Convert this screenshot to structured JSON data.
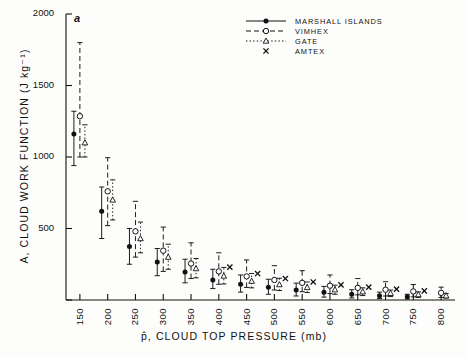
{
  "figure": {
    "panel_label": "a",
    "background": "#fdfdfb",
    "ink": "#111111"
  },
  "legend": {
    "position": "top-right",
    "entries": [
      {
        "label": "MARSHALL ISLANDS",
        "marker": "filled-circle",
        "line": "solid",
        "key": "marshall"
      },
      {
        "label": "VIMHEX",
        "marker": "open-circle",
        "line": "dashed",
        "key": "vimhex"
      },
      {
        "label": "GATE",
        "marker": "triangle",
        "line": "dotted",
        "key": "gate"
      },
      {
        "label": "AMTEX",
        "marker": "cross",
        "line": "none",
        "key": "amtex"
      }
    ]
  },
  "chart_data": {
    "type": "scatter",
    "title": "",
    "xlabel": "p̂, CLOUD TOP PRESSURE (mb)",
    "ylabel": "A, CLOUD WORK FUNCTION  (J kg⁻¹)",
    "xlim": [
      125,
      825
    ],
    "ylim": [
      0,
      2000
    ],
    "xticks": [
      150,
      200,
      250,
      300,
      350,
      400,
      450,
      500,
      550,
      600,
      650,
      700,
      750,
      800
    ],
    "yticks": [
      0,
      500,
      1000,
      1500,
      2000
    ],
    "ytick_labels": [
      "",
      "500",
      "1000",
      "1500",
      "2000"
    ],
    "grid": false,
    "series": [
      {
        "name": "MARSHALL ISLANDS",
        "marker": "filled-circle",
        "line": "solid",
        "x": [
          150,
          200,
          250,
          300,
          350,
          400,
          450,
          500,
          550,
          600,
          650,
          700,
          750
        ],
        "y": [
          1160,
          620,
          375,
          265,
          195,
          140,
          110,
          90,
          70,
          55,
          40,
          30,
          22
        ],
        "ylow": [
          940,
          430,
          250,
          170,
          120,
          80,
          55,
          40,
          28,
          20,
          14,
          10,
          7
        ],
        "yhigh": [
          1320,
          790,
          500,
          360,
          285,
          215,
          175,
          145,
          118,
          95,
          72,
          55,
          40
        ]
      },
      {
        "name": "VIMHEX",
        "marker": "open-circle",
        "line": "dashed",
        "x": [
          150,
          200,
          250,
          300,
          350,
          400,
          450,
          500,
          550,
          600,
          650,
          700,
          750,
          800
        ],
        "y": [
          1285,
          760,
          480,
          345,
          255,
          200,
          165,
          140,
          120,
          100,
          85,
          72,
          60,
          50
        ],
        "ylow": [
          1000,
          520,
          300,
          200,
          150,
          110,
          88,
          70,
          58,
          45,
          36,
          28,
          22,
          18
        ],
        "yhigh": [
          1800,
          995,
          690,
          510,
          400,
          330,
          280,
          240,
          205,
          175,
          150,
          128,
          108,
          90
        ]
      },
      {
        "name": "GATE",
        "marker": "triangle",
        "line": "dotted",
        "x": [
          150,
          200,
          250,
          300,
          350,
          400,
          450,
          500,
          550,
          600,
          650,
          700,
          750,
          800
        ],
        "y": [
          1100,
          700,
          430,
          300,
          220,
          168,
          132,
          108,
          88,
          72,
          58,
          47,
          38,
          30
        ],
        "ylow": [
          1000,
          560,
          330,
          215,
          155,
          112,
          85,
          66,
          52,
          40,
          31,
          24,
          18,
          14
        ],
        "yhigh": [
          1225,
          840,
          545,
          390,
          290,
          228,
          185,
          152,
          126,
          104,
          85,
          70,
          57,
          46
        ]
      },
      {
        "name": "AMTEX",
        "marker": "cross",
        "line": "none",
        "x": [
          400,
          450,
          500,
          550,
          600,
          650,
          700,
          750
        ],
        "y": [
          230,
          185,
          150,
          126,
          106,
          90,
          76,
          64
        ],
        "ylow": [
          null,
          null,
          null,
          null,
          null,
          null,
          null,
          null
        ],
        "yhigh": [
          null,
          null,
          null,
          null,
          null,
          null,
          null,
          null
        ]
      }
    ]
  }
}
